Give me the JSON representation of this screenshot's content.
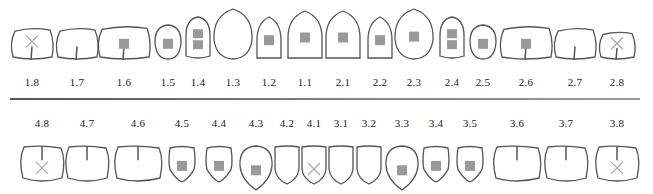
{
  "chart": {
    "colors": {
      "outline": "#555555",
      "filling": "#999999",
      "missing_mark": "#aaaaaa",
      "label": "#222222"
    },
    "upper": [
      {
        "id": "1.8",
        "shape": "molar",
        "mark": "missing",
        "fissure": true
      },
      {
        "id": "1.7",
        "shape": "molar",
        "mark": "none",
        "fissure": true
      },
      {
        "id": "1.6",
        "shape": "molar-large",
        "mark": "filling",
        "fissure": true
      },
      {
        "id": "1.5",
        "shape": "premolar",
        "mark": "filling",
        "fissure": false
      },
      {
        "id": "1.4",
        "shape": "premolar-tall",
        "mark": "double-filling",
        "fissure": false
      },
      {
        "id": "1.3",
        "shape": "canine",
        "mark": "none",
        "fissure": false
      },
      {
        "id": "1.2",
        "shape": "incisor",
        "mark": "filling",
        "fissure": false
      },
      {
        "id": "1.1",
        "shape": "incisor-large",
        "mark": "filling",
        "fissure": false
      },
      {
        "id": "2.1",
        "shape": "incisor-large",
        "mark": "filling",
        "fissure": false
      },
      {
        "id": "2.2",
        "shape": "incisor",
        "mark": "filling",
        "fissure": false
      },
      {
        "id": "2.3",
        "shape": "canine",
        "mark": "filling",
        "fissure": false
      },
      {
        "id": "2.4",
        "shape": "premolar-tall",
        "mark": "double-filling",
        "fissure": false
      },
      {
        "id": "2.5",
        "shape": "premolar",
        "mark": "filling",
        "fissure": false
      },
      {
        "id": "2.6",
        "shape": "molar-large",
        "mark": "filling",
        "fissure": true
      },
      {
        "id": "2.7",
        "shape": "molar",
        "mark": "none",
        "fissure": true
      },
      {
        "id": "2.8",
        "shape": "molar-small",
        "mark": "missing",
        "fissure": true
      }
    ],
    "lower": [
      {
        "id": "4.8",
        "shape": "lmolar",
        "mark": "missing",
        "fissure": true
      },
      {
        "id": "4.7",
        "shape": "lmolar",
        "mark": "none",
        "fissure": true
      },
      {
        "id": "4.6",
        "shape": "lmolar-large",
        "mark": "none",
        "fissure": true
      },
      {
        "id": "4.5",
        "shape": "lpremolar",
        "mark": "filling",
        "fissure": false
      },
      {
        "id": "4.4",
        "shape": "lpremolar",
        "mark": "filling",
        "fissure": false
      },
      {
        "id": "4.3",
        "shape": "lcanine",
        "mark": "filling",
        "fissure": false
      },
      {
        "id": "4.2",
        "shape": "lincisor",
        "mark": "none",
        "fissure": false
      },
      {
        "id": "4.1",
        "shape": "lincisor",
        "mark": "missing",
        "fissure": false
      },
      {
        "id": "3.1",
        "shape": "lincisor",
        "mark": "none",
        "fissure": false
      },
      {
        "id": "3.2",
        "shape": "lincisor",
        "mark": "none",
        "fissure": false
      },
      {
        "id": "3.3",
        "shape": "lcanine",
        "mark": "filling",
        "fissure": false
      },
      {
        "id": "3.4",
        "shape": "lpremolar",
        "mark": "filling",
        "fissure": false
      },
      {
        "id": "3.5",
        "shape": "lpremolar",
        "mark": "filling",
        "fissure": false
      },
      {
        "id": "3.6",
        "shape": "lmolar-large",
        "mark": "none",
        "fissure": true
      },
      {
        "id": "3.7",
        "shape": "lmolar",
        "mark": "none",
        "fissure": true
      },
      {
        "id": "3.8",
        "shape": "lmolar",
        "mark": "missing",
        "fissure": true
      }
    ]
  }
}
